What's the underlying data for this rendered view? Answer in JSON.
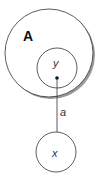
{
  "diagram": {
    "outer_set": {
      "label": "A"
    },
    "inner_element": {
      "label": "y"
    },
    "edge": {
      "label": "a"
    },
    "external_element": {
      "label": "x"
    },
    "colors": {
      "stroke": "#333333",
      "shadow": "#9a9a9a",
      "fill": "#ffffff"
    }
  }
}
